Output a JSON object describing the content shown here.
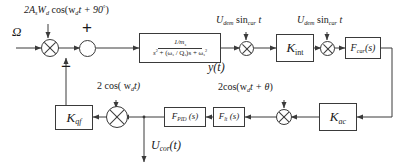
{
  "diagram": {
    "width": 404,
    "height": 168,
    "line_color": "#3a3a3a",
    "text_color": "#1a1a1a",
    "background": "#ffffff"
  },
  "inputs": {
    "omega": "Ω",
    "drive_force": "2A",
    "drive_force_sub1": "s",
    "drive_force_mid": "W",
    "drive_force_sub2": "d",
    "drive_force_tail": " cos(w",
    "drive_force_sub3": "d",
    "drive_force_end": "t + 90",
    "drive_force_deg": "°",
    "drive_force_close": ")"
  },
  "signs": {
    "plus": "+",
    "minus": "−"
  },
  "blocks": {
    "plant": {
      "numerator": "1/m",
      "numerator_sub": "s",
      "denominator_a": "s",
      "denominator_a_sup": "2",
      "denominator_b": " + (ω",
      "denominator_b_sub": "s",
      "denominator_c": " / Q",
      "denominator_c_sub": "s",
      "denominator_d": ")s + ω",
      "denominator_d_sub": "s",
      "denominator_d_sup": "2"
    },
    "k_int": {
      "base": "K",
      "sub": "int"
    },
    "f_car": {
      "base": "F",
      "sub": "car",
      "arg": "(s)"
    },
    "k_ac": {
      "base": "K",
      "sub": "ac"
    },
    "f_lt": {
      "base": "F",
      "sub": "lt",
      "arg": " (s)"
    },
    "f_pid": {
      "base": "F",
      "sub": "PID",
      "arg": " (s)"
    },
    "k_qf": {
      "base": "K",
      "sub": "qf"
    }
  },
  "signals": {
    "plant_output": "y(t)",
    "correction_output": "U",
    "correction_output_sub": "cor",
    "correction_output_tail": "(t)",
    "demod_carrier_1": "U",
    "demod_carrier_1_sub": "dem",
    "demod_carrier_1_mid": " sin",
    "demod_carrier_1_sub2": "car",
    "demod_carrier_1_tail": " t",
    "demod_carrier_2": "U",
    "demod_carrier_2_sub": "dem",
    "demod_carrier_2_mid": " sin",
    "demod_carrier_2_sub2": "car",
    "demod_carrier_2_tail": " t",
    "demod_drive": "2 cos( w",
    "demod_drive_sub": "d",
    "demod_drive_tail": "t)",
    "demod_phase": "2cos(w",
    "demod_phase_sub": "d",
    "demod_phase_mid": "t + ",
    "demod_phase_theta": "θ",
    "demod_phase_close": ")"
  }
}
